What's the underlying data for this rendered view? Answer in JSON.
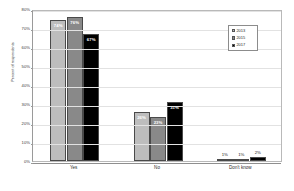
{
  "chart_data": {
    "type": "bar",
    "title": "",
    "xlabel": "",
    "ylabel": "Percent of respondents",
    "ylim": [
      0,
      80
    ],
    "ytick_labels": [
      "80%",
      "70%",
      "60%",
      "50%",
      "40%",
      "30%",
      "20%",
      "10%",
      "0%"
    ],
    "ytick_values": [
      80,
      70,
      60,
      50,
      40,
      30,
      20,
      10,
      0
    ],
    "grid": true,
    "legend_position": "upper-right-inside",
    "categories": [
      "Yes",
      "No",
      "Don't know"
    ],
    "series": [
      {
        "name": "2013",
        "color": "#bdbdbd",
        "values": [
          74,
          26,
          1
        ],
        "labels": [
          "74%",
          "26%",
          "1%"
        ]
      },
      {
        "name": "2015",
        "color": "#898989",
        "values": [
          76,
          23,
          1
        ],
        "labels": [
          "76%",
          "23%",
          "1%"
        ]
      },
      {
        "name": "2017",
        "color": "#000000",
        "values": [
          67,
          31,
          2
        ],
        "labels": [
          "67%",
          "31%",
          "2%"
        ]
      }
    ]
  },
  "colors": {
    "background": "#ffffff",
    "gridline": "#e2e2e2",
    "axis": "#8f8f8f",
    "text": "#2b2b2b",
    "series_2013": "#bdbdbd",
    "series_2015": "#898989",
    "series_2017": "#000000"
  }
}
